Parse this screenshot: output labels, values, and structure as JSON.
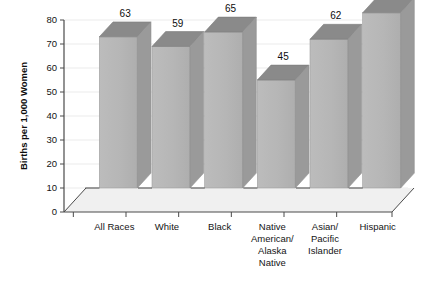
{
  "chart_data": {
    "type": "bar",
    "title": "",
    "subtitle": "",
    "xlabel": "",
    "ylabel": "Births per 1,000 Women",
    "categories": [
      "All Races",
      "Native American/ Alaska Native",
      "White",
      "Black",
      "Asian/ Pacific Islander",
      "Hispanic"
    ],
    "category_order": [
      "All Races",
      "White",
      "Black",
      "Native American/ Alaska Native",
      "Asian/ Pacific Islander",
      "Hispanic"
    ],
    "category_lines": [
      [
        "All Races"
      ],
      [
        "White"
      ],
      [
        "Black"
      ],
      [
        "Native",
        "American/",
        "Alaska",
        "Native"
      ],
      [
        "Asian/",
        "Pacific",
        "Islander"
      ],
      [
        "Hispanic"
      ]
    ],
    "values": [
      63,
      59,
      65,
      45,
      62,
      73
    ],
    "value_labels": [
      "63",
      "59",
      "65",
      "45",
      "62",
      "73"
    ],
    "ylim": [
      0,
      80
    ],
    "yticks": [
      0,
      10,
      20,
      30,
      40,
      50,
      60,
      70,
      80
    ],
    "ytick_labels": [
      "0",
      "10",
      "20",
      "30",
      "40",
      "50",
      "60",
      "70",
      "80"
    ],
    "grid": true,
    "legend": null,
    "legend_position": "none",
    "style": "3d-column",
    "colors": {
      "bar_front": "#b4b4b4",
      "bar_top": "#8a8a8a",
      "bar_side": "#9a9a9a",
      "floor": "#f0f0f0",
      "axis": "#4a4a4a",
      "grid": "#ebebeb",
      "text": "#141414",
      "background": "#ffffff"
    }
  },
  "axis": {
    "y_title": "Births per 1,000 Women"
  }
}
